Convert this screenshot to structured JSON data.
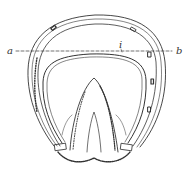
{
  "figure": {
    "labels": {
      "a": "a",
      "b": "b",
      "i": "i"
    },
    "section_line": {
      "from": "a",
      "to": "b",
      "style": "dashed"
    },
    "nail_holes_visible": 5,
    "colors": {
      "ink": "#333333",
      "background": "#ffffff"
    }
  }
}
